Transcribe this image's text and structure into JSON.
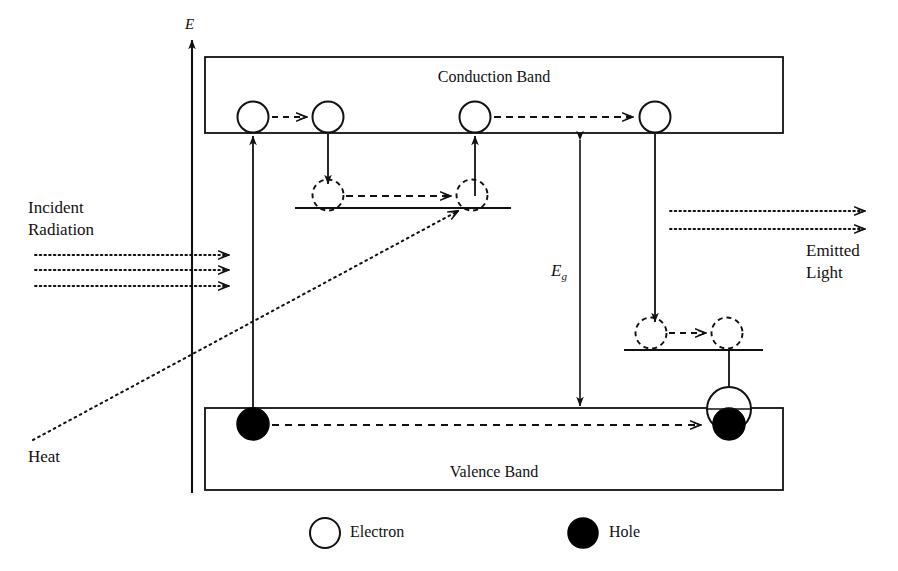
{
  "figure": {
    "type": "semiconductor-energy-band-diagram",
    "axis_label": "E",
    "bands": {
      "conduction_label": "Conduction Band",
      "valence_label": "Valence Band"
    },
    "gap_label_base": "E",
    "gap_label_sub": "g",
    "annotations": {
      "incident_line1": "Incident",
      "incident_line2": "Radiation",
      "emitted_line1": "Emitted",
      "emitted_line2": "Light",
      "heat": "Heat"
    },
    "legend": [
      {
        "key": "electron",
        "label": "Electron",
        "fill": "#ffffff"
      },
      {
        "key": "hole",
        "label": "Hole",
        "fill": "#000000"
      }
    ],
    "colors": {
      "ink": "#111111",
      "paper": "#ffffff",
      "electron_fill": "#ffffff",
      "hole_fill": "#000000"
    }
  }
}
